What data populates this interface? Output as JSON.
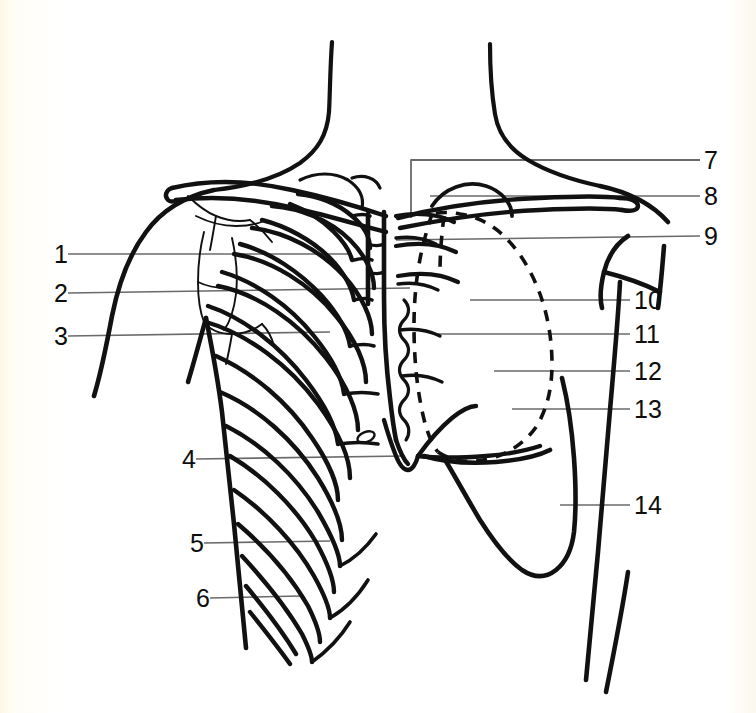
{
  "figure": {
    "type": "anatomical-line-diagram",
    "background_color": "#fffdf5",
    "ink_color": "#111111",
    "width": 756,
    "height": 713
  },
  "labels": {
    "left": [
      {
        "id": "1",
        "text": "1",
        "x": 50,
        "y": 254,
        "leader_to_x": 352,
        "leader_to_y": 254
      },
      {
        "id": "2",
        "text": "2",
        "x": 50,
        "y": 293,
        "leader_to_x": 410,
        "leader_to_y": 288
      },
      {
        "id": "3",
        "text": "3",
        "x": 50,
        "y": 336,
        "leader_to_x": 330,
        "leader_to_y": 332
      },
      {
        "id": "4",
        "text": "4",
        "x": 178,
        "y": 459,
        "leader_to_x": 405,
        "leader_to_y": 456
      },
      {
        "id": "5",
        "text": "5",
        "x": 186,
        "y": 543,
        "leader_to_x": 330,
        "leader_to_y": 541
      },
      {
        "id": "6",
        "text": "6",
        "x": 192,
        "y": 598,
        "leader_to_x": 300,
        "leader_to_y": 596
      }
    ],
    "right": [
      {
        "id": "7",
        "text": "7",
        "x": 710,
        "y": 160,
        "leader_to_x": 411,
        "leader_to_y": 160,
        "bracket": true,
        "bracket_drop_y": 218
      },
      {
        "id": "8",
        "text": "8",
        "x": 710,
        "y": 196,
        "leader_to_x": 430,
        "leader_to_y": 196
      },
      {
        "id": "9",
        "text": "9",
        "x": 710,
        "y": 236,
        "leader_to_x": 396,
        "leader_to_y": 240
      },
      {
        "id": "10",
        "text": "10",
        "x": 640,
        "y": 300,
        "leader_to_x": 470,
        "leader_to_y": 300
      },
      {
        "id": "11",
        "text": "11",
        "x": 640,
        "y": 334,
        "leader_to_x": 436,
        "leader_to_y": 334
      },
      {
        "id": "12",
        "text": "12",
        "x": 640,
        "y": 371,
        "leader_to_x": 494,
        "leader_to_y": 371
      },
      {
        "id": "13",
        "text": "13",
        "x": 640,
        "y": 409,
        "leader_to_x": 512,
        "leader_to_y": 409
      },
      {
        "id": "14",
        "text": "14",
        "x": 640,
        "y": 505,
        "leader_to_x": 560,
        "leader_to_y": 505
      }
    ]
  },
  "structures": [
    {
      "name": "neck-outline",
      "style": "thick-solid"
    },
    {
      "name": "shoulder-outline-left",
      "style": "thick-solid"
    },
    {
      "name": "shoulder-outline-right",
      "style": "thick-solid"
    },
    {
      "name": "clavicle-left",
      "style": "thick-solid"
    },
    {
      "name": "clavicle-right",
      "style": "thick-solid"
    },
    {
      "name": "scapula-left",
      "style": "thin-solid"
    },
    {
      "name": "rib-cage",
      "style": "thick-solid"
    },
    {
      "name": "sternum",
      "style": "thick-solid"
    },
    {
      "name": "costal-cartilages",
      "style": "thick-solid"
    },
    {
      "name": "xiphoid-process",
      "style": "thick-solid"
    },
    {
      "name": "heart-outline",
      "style": "dashed"
    },
    {
      "name": "lung-border-right",
      "style": "thick-solid"
    },
    {
      "name": "arm-outline-right",
      "style": "thick-solid"
    },
    {
      "name": "torso-outline-left",
      "style": "thick-solid"
    },
    {
      "name": "torso-outline-right",
      "style": "thick-solid"
    },
    {
      "name": "nipple-marker",
      "style": "thin-solid"
    }
  ]
}
